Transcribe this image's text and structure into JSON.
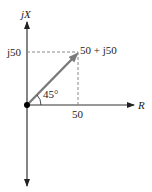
{
  "diagram": {
    "vertical_axis_label": "jX",
    "horizontal_axis_label": "R",
    "y_tick_label": "j50",
    "x_tick_label": "50",
    "phasor_label": "50 + j50",
    "angle_label": "45°",
    "colors": {
      "axes": "#333333",
      "phasor": "#7a7a7a",
      "dashed": "#888888",
      "origin": "#000000"
    }
  }
}
